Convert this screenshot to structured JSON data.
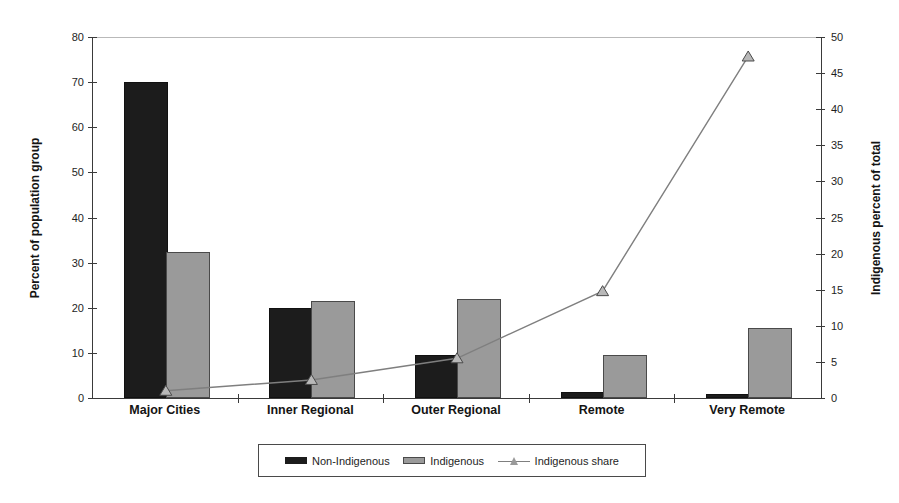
{
  "chart_data": {
    "type": "bar",
    "subtype": "dual-axis bar + line",
    "title": "",
    "categories": [
      "Major Cities",
      "Inner Regional",
      "Outer Regional",
      "Remote",
      "Very Remote"
    ],
    "series": [
      {
        "name": "Non-Indigenous",
        "kind": "bar",
        "axis": "left",
        "values": [
          69.5,
          19.5,
          9,
          1,
          0.4
        ]
      },
      {
        "name": "Indigenous",
        "kind": "bar",
        "axis": "left",
        "values": [
          32,
          21,
          21.5,
          9,
          15
        ]
      },
      {
        "name": "Indigenous share",
        "kind": "line",
        "axis": "right",
        "marker": "triangle",
        "values": [
          1,
          2.5,
          5.5,
          14.8,
          47.3
        ]
      }
    ],
    "left_axis": {
      "label": "Percent of population group",
      "min": 0,
      "max": 80,
      "ticks": [
        0,
        10,
        20,
        30,
        40,
        50,
        60,
        70,
        80
      ]
    },
    "right_axis": {
      "label": "Indigenous percent of total",
      "min": 0,
      "max": 50,
      "ticks": [
        0,
        5,
        10,
        15,
        20,
        25,
        30,
        35,
        40,
        45,
        50
      ]
    },
    "legend": {
      "position": "bottom",
      "entries": [
        "Non-Indigenous",
        "Indigenous",
        "Indigenous share"
      ]
    },
    "grid": "single light gridline at top (80 / 50)"
  },
  "colors": {
    "non_indigenous_bar": "#1c1c1c",
    "indigenous_bar": "#9a9a9a",
    "share_line": "#7f7f7f",
    "marker_fill": "#b8b8b8",
    "marker_stroke": "#4a4a4a",
    "axis": "#3a3a3a",
    "top_gridline": "#b9b9b9"
  }
}
